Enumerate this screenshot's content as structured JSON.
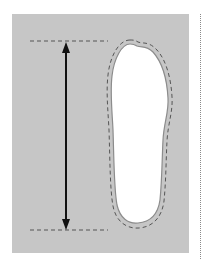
{
  "diagram": {
    "elements": [
      {
        "type": "background-panel",
        "color": "#c6c6c6"
      },
      {
        "type": "foot-outline",
        "fill": "#ffffff",
        "stroke": "#8c8c8c"
      },
      {
        "type": "dashed-tracing",
        "stroke": "#555555"
      },
      {
        "type": "double-arrow",
        "label": "foot length",
        "color": "#111111"
      },
      {
        "type": "dashed-guide-top"
      },
      {
        "type": "dashed-guide-bottom"
      },
      {
        "type": "dotted-separator"
      }
    ]
  }
}
